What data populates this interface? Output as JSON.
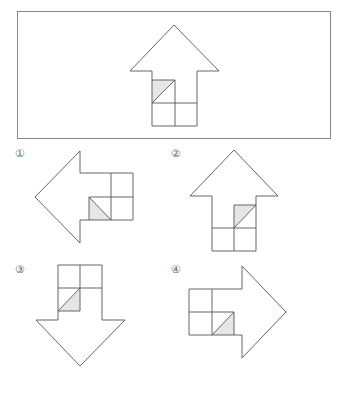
{
  "question": {
    "type": "rotation-figure-puzzle",
    "reference_figure": {
      "shape": "arrow",
      "direction": "up",
      "shaded_cell": "top-left",
      "shaded_half": "upper-left"
    }
  },
  "options": [
    {
      "label": "①",
      "direction": "left",
      "shaded_half": "lower-left"
    },
    {
      "label": "②",
      "direction": "up",
      "shaded_half": "upper-left"
    },
    {
      "label": "③",
      "direction": "down",
      "shaded_half": "lower-right"
    },
    {
      "label": "④",
      "direction": "right",
      "shaded_half": "lower-right"
    }
  ],
  "colors": {
    "stroke": "#555555",
    "frame": "#888888",
    "shade": "#e6e6e6",
    "background": "#ffffff"
  }
}
